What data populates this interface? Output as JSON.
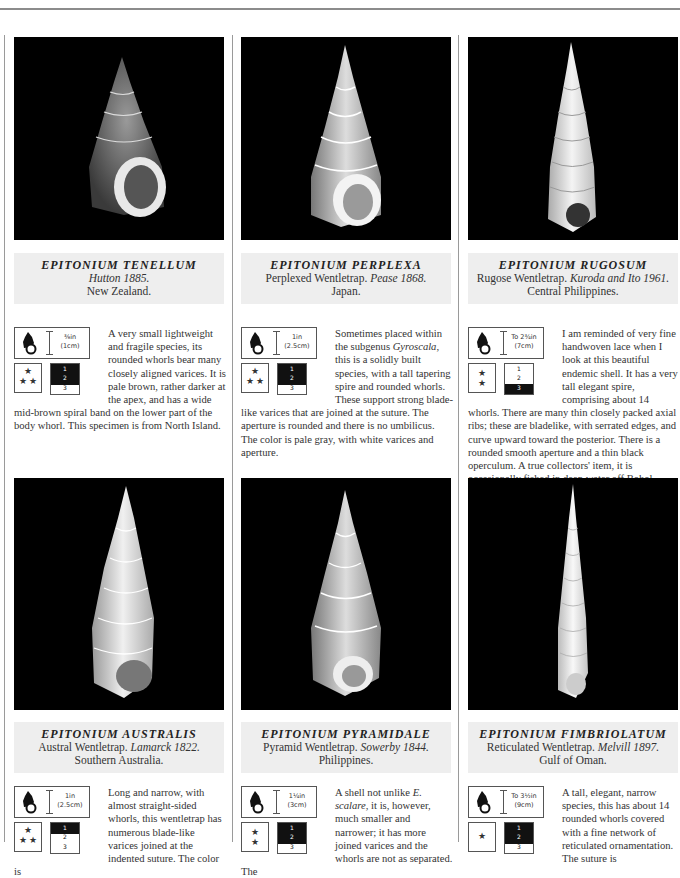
{
  "page": {
    "accent_caption_bg": "#eeeeee",
    "photo_bg": "#000000"
  },
  "entries": [
    {
      "species": "EPITONIUM TENELLUM",
      "common": "",
      "author": "Hutton 1885.",
      "locality": "New Zealand.",
      "size_imperial": "⅜in",
      "size_metric": "(1cm)",
      "stars": "★ ★★",
      "depth_levels": [
        "1",
        "2",
        "3"
      ],
      "depth_fill": "1-2",
      "description": "A very small lightweight and fragile species, its rounded whorls bear many closely aligned varices. It is pale brown, rather darker at the apex, and has a wide mid-brown spiral band on the lower part of the body whorl. This specimen is from North Island."
    },
    {
      "species": "EPITONIUM PERPLEXA",
      "common": "Perplexed Wentletrap.",
      "author": "Pease 1868.",
      "locality": "Japan.",
      "size_imperial": "1in",
      "size_metric": "(2.5cm)",
      "stars": "★ ★★",
      "depth_levels": [
        "1",
        "2",
        "3"
      ],
      "depth_fill": "1-2",
      "description_pre": "Sometimes placed within the subgenus ",
      "description_italic": "Gyroscala",
      "description_post": ", this is a solidly built species, with a tall tapering spire and rounded whorls. These support strong blade-like varices that are joined at the suture. The aperture is rounded and there is no umbilicus. The color is pale gray, with white varices and aperture."
    },
    {
      "species": "EPITONIUM RUGOSUM",
      "common": "Rugose Wentletrap.",
      "author": "Kuroda and Ito 1961.",
      "locality": "Central Philippines.",
      "size_imperial": "To 2¾in",
      "size_metric": "(7cm)",
      "stars": "★ ★",
      "depth_levels": [
        "1",
        "2",
        "3"
      ],
      "depth_fill": "3",
      "description": "I am reminded of very fine handwoven lace when I look at this beautiful endemic shell. It has a very tall elegant spire, comprising about 14 whorls. There are many thin closely packed axial ribs; these are bladelike, with serrated edges, and curve upward toward the posterior. There is a rounded smooth aperture and a thin black operculum. A true collectors' item, it is occasionally fished in deep water off Bohol Island."
    },
    {
      "species": "EPITONIUM AUSTRALIS",
      "common": "Austral Wentletrap.",
      "author": "Lamarck 1822.",
      "locality": "Southern Australia.",
      "size_imperial": "1in",
      "size_metric": "(2.5cm)",
      "stars": "★ ★★",
      "depth_levels": [
        "1",
        "2",
        "3"
      ],
      "depth_fill": "1",
      "description": "Long and narrow, with almost straight-sided whorls, this wentletrap has numerous blade-like varices joined at the indented suture. The color is"
    },
    {
      "species": "EPITONIUM PYRAMIDALE",
      "common": "Pyramid Wentletrap.",
      "author": "Sowerby 1844.",
      "locality": "Philippines.",
      "size_imperial": "1¼in",
      "size_metric": "(3cm)",
      "stars": "★ ★",
      "depth_levels": [
        "1",
        "2",
        "3"
      ],
      "depth_fill": "1-2",
      "description_pre": "A shell not unlike ",
      "description_italic": "E. scalare",
      "description_post": ", it is, however, much smaller and narrower; it has more joined varices and the whorls are not as separated. The"
    },
    {
      "species": "EPITONIUM FIMBRIOLATUM",
      "common": "Reticulated Wentletrap.",
      "author": "Melvill 1897.",
      "locality": "Gulf of Oman.",
      "size_imperial": "To 3½in",
      "size_metric": "(9cm)",
      "stars": "★",
      "depth_levels": [
        "1",
        "2",
        "3"
      ],
      "depth_fill": "1-2",
      "description": "A tall, elegant, narrow species, this has about 14 rounded whorls covered with a fine network of reticulated ornamentation. The suture is"
    }
  ]
}
